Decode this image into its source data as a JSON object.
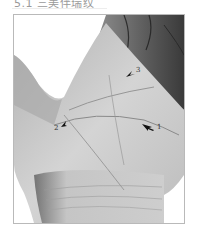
{
  "heading": {
    "text": "5.1 三美伴瑞纹"
  },
  "figure": {
    "colors": {
      "frame_border": "#b9b9b9",
      "skin_light": "#d9d9d9",
      "skin_mid": "#a8a8a8",
      "skin_dark": "#4a4a4a"
    },
    "markers": [
      {
        "id": "1",
        "label": "1",
        "direction": "left"
      },
      {
        "id": "2",
        "label": "2",
        "direction": "up-right"
      },
      {
        "id": "3",
        "label": "3",
        "direction": "down-left"
      }
    ]
  }
}
